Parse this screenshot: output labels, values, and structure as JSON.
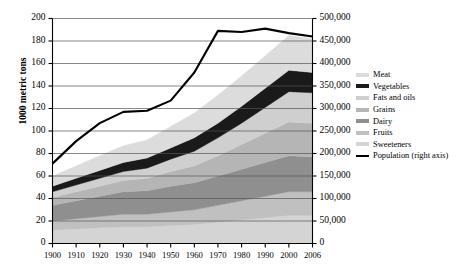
{
  "chart_data": {
    "type": "area",
    "title": "",
    "subtitle": "",
    "xlabel": "",
    "ylabel": "1000 metric tons",
    "y2label": "",
    "grid": true,
    "legend_position": "right",
    "stacked": true,
    "x": [
      1900,
      1910,
      1920,
      1930,
      1940,
      1950,
      1960,
      1970,
      1980,
      1990,
      2000,
      2006
    ],
    "xtick_labels": [
      "1900",
      "1910",
      "1920",
      "1930",
      "1940",
      "1950",
      "1960",
      "1970",
      "1980",
      "1990",
      "2000",
      "2006"
    ],
    "ylim": [
      0,
      200
    ],
    "ytick_labels": [
      "0",
      "20",
      "40",
      "60",
      "80",
      "100",
      "120",
      "140",
      "160",
      "180",
      "200"
    ],
    "ytick_values": [
      0,
      20,
      40,
      60,
      80,
      100,
      120,
      140,
      160,
      180,
      200
    ],
    "y2lim": [
      0,
      500000
    ],
    "y2tick_labels": [
      "0",
      "50,000",
      "100,000",
      "150,000",
      "200,000",
      "250,000",
      "300,000",
      "350,000",
      "400,000",
      "450,000",
      "500,000"
    ],
    "y2tick_values": [
      0,
      50000,
      100000,
      150000,
      200000,
      250000,
      300000,
      350000,
      400000,
      450000,
      500000
    ],
    "series": [
      {
        "name": "Sweeteners",
        "order": 1,
        "color": "#d4d4d4",
        "values": [
          12,
          13,
          14,
          15,
          15,
          16,
          17,
          19,
          21,
          23,
          25,
          25
        ]
      },
      {
        "name": "Fruits",
        "order": 2,
        "color": "#c0c0c0",
        "values": [
          8,
          9,
          10,
          11,
          11,
          12,
          13,
          15,
          17,
          19,
          21,
          21
        ]
      },
      {
        "name": "Dairy",
        "order": 3,
        "color": "#8f8f8f",
        "values": [
          14,
          16,
          18,
          20,
          21,
          23,
          24,
          26,
          28,
          30,
          32,
          31
        ]
      },
      {
        "name": "Grains",
        "order": 4,
        "color": "#b5b5b5",
        "values": [
          7,
          8,
          9,
          10,
          11,
          13,
          15,
          18,
          22,
          26,
          30,
          30
        ]
      },
      {
        "name": "Fats and oils",
        "order": 5,
        "color": "#cfcfcf",
        "values": [
          5,
          6,
          7,
          8,
          9,
          11,
          13,
          16,
          19,
          23,
          27,
          27
        ]
      },
      {
        "name": "Vegetables",
        "order": 6,
        "color": "#1a1a1a",
        "values": [
          5,
          6,
          7,
          8,
          9,
          10,
          12,
          13,
          15,
          17,
          19,
          18
        ]
      },
      {
        "name": "Meat",
        "order": 7,
        "color": "#dcdcdc",
        "values": [
          9,
          11,
          13,
          15,
          16,
          19,
          22,
          25,
          27,
          29,
          31,
          30
        ]
      }
    ],
    "population_line": {
      "name": "Population (right axis)",
      "color": "#000000",
      "axis": "right",
      "values_right_axis": [
        178000,
        228000,
        268000,
        292000,
        295000,
        318000,
        380000,
        472000,
        470000,
        478000,
        468000,
        460000
      ],
      "values_left_axis_scale": [
        71,
        91,
        107,
        117,
        118,
        127,
        152,
        189,
        188,
        191,
        187,
        184
      ]
    },
    "legend_entries": [
      {
        "label": "Meat",
        "color": "#dcdcdc",
        "style": "band"
      },
      {
        "label": "Vegetables",
        "color": "#1a1a1a",
        "style": "band"
      },
      {
        "label": "Fats and oils",
        "color": "#cfcfcf",
        "style": "band"
      },
      {
        "label": "Grains",
        "color": "#b5b5b5",
        "style": "band"
      },
      {
        "label": "Dairy",
        "color": "#8f8f8f",
        "style": "band"
      },
      {
        "label": "Fruits",
        "color": "#c0c0c0",
        "style": "band"
      },
      {
        "label": "Sweeteners",
        "color": "#d4d4d4",
        "style": "band"
      },
      {
        "label": "Population (right axis)",
        "color": "#000000",
        "style": "line"
      }
    ]
  },
  "axes": {
    "y_title": "1000 metric tons"
  }
}
